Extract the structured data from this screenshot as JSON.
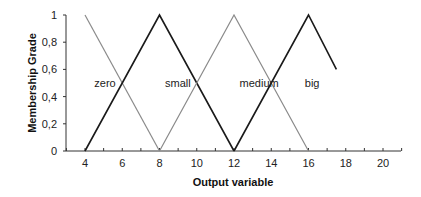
{
  "chart_data": {
    "type": "line",
    "title": "",
    "xlabel": "Output variable",
    "ylabel": "Membership Grade",
    "xlim": [
      3,
      21
    ],
    "ylim": [
      0,
      1
    ],
    "x_ticks": [
      "4",
      "6",
      "8",
      "10",
      "12",
      "14",
      "16",
      "18",
      "20"
    ],
    "y_ticks": [
      "0",
      "0,2",
      "0,4",
      "0,6",
      "0,8",
      "1"
    ],
    "grid": false,
    "legend": "none (inline labels)",
    "series": [
      {
        "name": "zero",
        "color": "#8a8a8a",
        "points": [
          [
            4,
            1
          ],
          [
            8,
            0
          ]
        ]
      },
      {
        "name": "small",
        "color": "#1a1a1a",
        "points": [
          [
            4,
            0
          ],
          [
            8,
            1
          ],
          [
            12,
            0
          ]
        ]
      },
      {
        "name": "medium",
        "color": "#8a8a8a",
        "points": [
          [
            8,
            0
          ],
          [
            12,
            1
          ],
          [
            16,
            0
          ]
        ]
      },
      {
        "name": "big",
        "color": "#1a1a1a",
        "points": [
          [
            12,
            0
          ],
          [
            16,
            1
          ],
          [
            17.5,
            0.6
          ]
        ]
      }
    ],
    "annotations": [
      {
        "text": "zero",
        "x": 4.5,
        "y": 0.5
      },
      {
        "text": "small",
        "x": 8.3,
        "y": 0.5
      },
      {
        "text": "medium",
        "x": 12.3,
        "y": 0.5
      },
      {
        "text": "big",
        "x": 15.8,
        "y": 0.5
      }
    ]
  }
}
